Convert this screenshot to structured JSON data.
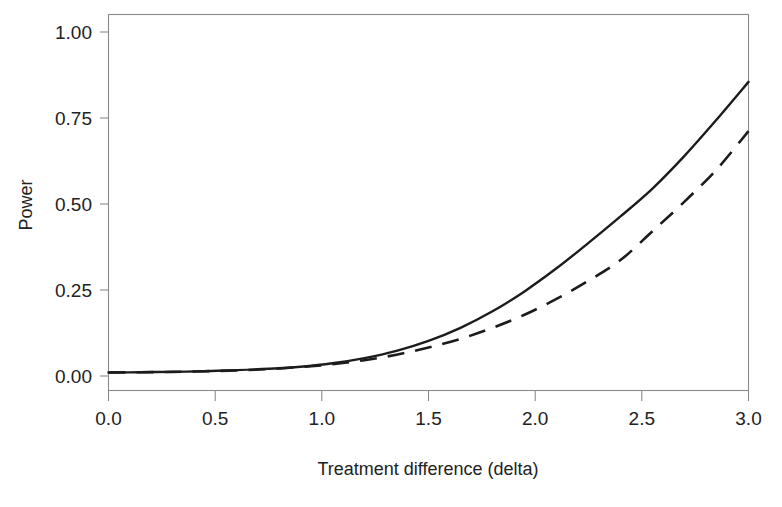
{
  "figure": {
    "caption_partial": ""
  },
  "chart_data": {
    "type": "line",
    "title": "",
    "xlabel": "Treatment difference (delta)",
    "ylabel": "Power",
    "xlim": [
      0.0,
      3.0
    ],
    "ylim": [
      0.0,
      1.0
    ],
    "xticks": [
      "0.0",
      "0.5",
      "1.0",
      "1.5",
      "2.0",
      "2.5",
      "3.0"
    ],
    "xtick_values": [
      0.0,
      0.5,
      1.0,
      1.5,
      2.0,
      2.5,
      3.0
    ],
    "yticks": [
      "0.00",
      "0.25",
      "0.50",
      "0.75",
      "1.00"
    ],
    "ytick_values": [
      0.0,
      0.25,
      0.5,
      0.75,
      1.0
    ],
    "grid": false,
    "legend": null,
    "x": [
      0.0,
      0.15,
      0.3,
      0.45,
      0.6,
      0.75,
      0.9,
      1.05,
      1.2,
      1.35,
      1.5,
      1.65,
      1.8,
      1.95,
      2.1,
      2.25,
      2.4,
      2.55,
      2.7,
      2.85,
      3.0
    ],
    "series": [
      {
        "name": "solid-curve",
        "style": "solid",
        "color": "#1c1c1c",
        "values": [
          0.01,
          0.011,
          0.012,
          0.014,
          0.017,
          0.021,
          0.027,
          0.037,
          0.052,
          0.073,
          0.102,
          0.14,
          0.188,
          0.246,
          0.313,
          0.387,
          0.464,
          0.545,
          0.64,
          0.745,
          0.855
        ]
      },
      {
        "name": "dashed-curve",
        "style": "dashed",
        "color": "#1c1c1c",
        "values": [
          0.01,
          0.011,
          0.012,
          0.014,
          0.016,
          0.02,
          0.026,
          0.034,
          0.046,
          0.062,
          0.083,
          0.108,
          0.14,
          0.178,
          0.224,
          0.277,
          0.337,
          0.421,
          0.507,
          0.6,
          0.712
        ]
      }
    ]
  },
  "colors": {
    "curve": "#1c1c1c",
    "frame": "#8a8a8a",
    "text": "#222222",
    "background": "#ffffff"
  }
}
